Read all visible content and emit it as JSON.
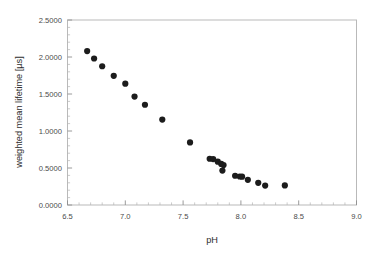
{
  "chart_data": {
    "type": "scatter",
    "title": "",
    "xlabel": "pH",
    "ylabel": "weighted mean lifetime  [µs]",
    "xlim": [
      6.5,
      9.0
    ],
    "ylim": [
      0.0,
      2.5
    ],
    "xticks": [
      6.5,
      7.0,
      7.5,
      8.0,
      8.5,
      9.0
    ],
    "xticklabels": [
      "6.5",
      "7.0",
      "7.5",
      "8.0",
      "8.5",
      "9.0"
    ],
    "yticks": [
      0.0,
      0.5,
      1.0,
      1.5,
      2.0,
      2.5
    ],
    "yticklabels": [
      "0.0000",
      "0.5000",
      "1.0000",
      "1.5000",
      "2.0000",
      "2.5000"
    ],
    "x_minor_interval": 0.1,
    "y_minor_interval": 0.1,
    "grid": false,
    "legend": null,
    "marker": {
      "shape": "circle",
      "color": "#1c1c1c",
      "size_px": 3.1
    },
    "series": [
      {
        "name": "weighted mean lifetime vs pH",
        "points": [
          {
            "x": 6.67,
            "y": 2.08
          },
          {
            "x": 6.73,
            "y": 1.98
          },
          {
            "x": 6.8,
            "y": 1.875
          },
          {
            "x": 6.9,
            "y": 1.745
          },
          {
            "x": 7.0,
            "y": 1.64
          },
          {
            "x": 7.08,
            "y": 1.465
          },
          {
            "x": 7.17,
            "y": 1.355
          },
          {
            "x": 7.32,
            "y": 1.155
          },
          {
            "x": 7.56,
            "y": 0.845
          },
          {
            "x": 7.73,
            "y": 0.625
          },
          {
            "x": 7.76,
            "y": 0.62
          },
          {
            "x": 7.8,
            "y": 0.585
          },
          {
            "x": 7.83,
            "y": 0.555
          },
          {
            "x": 7.85,
            "y": 0.54
          },
          {
            "x": 7.84,
            "y": 0.465
          },
          {
            "x": 7.95,
            "y": 0.395
          },
          {
            "x": 7.99,
            "y": 0.385
          },
          {
            "x": 8.01,
            "y": 0.383
          },
          {
            "x": 8.06,
            "y": 0.34
          },
          {
            "x": 8.15,
            "y": 0.3
          },
          {
            "x": 8.21,
            "y": 0.262
          },
          {
            "x": 8.38,
            "y": 0.265
          }
        ]
      }
    ]
  },
  "colors": {
    "marker": "#1c1c1c",
    "frame": "#b9b9b9",
    "tick_major": "#8f8f8f",
    "tick_minor": "#b5b5b5",
    "text": "#3a3a3a",
    "background": "#ffffff"
  }
}
